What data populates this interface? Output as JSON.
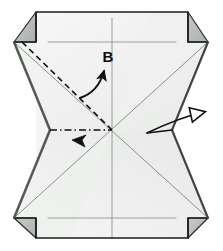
{
  "diagram": {
    "type": "origami-instruction",
    "canvas": {
      "width": 223,
      "height": 251,
      "background": "#ffffff"
    },
    "colors": {
      "paper_front": "#f2f3f2",
      "paper_front_light": "#f7f8f7",
      "paper_back_shade": "#b9bcb9",
      "paper_mid_shade": "#d9dbd9",
      "outline": "#1c1c1c",
      "soft_crease": "#9aa09a",
      "arrow": "#111111",
      "label": "#0a0a0a"
    },
    "labels": [
      {
        "id": "label-b",
        "text": "B",
        "x": 108,
        "y": 62
      }
    ],
    "arrows": [
      {
        "id": "arrow-b",
        "name": "fold-arrow-b",
        "style": "curved-solid",
        "from": {
          "x": 83,
          "y": 96
        },
        "to": {
          "x": 105,
          "y": 68
        },
        "points_to_label": "B"
      },
      {
        "id": "arrow-a",
        "name": "fold-arrowhead-a",
        "style": "arrowhead-only",
        "at": {
          "x": 78,
          "y": 140
        },
        "direction": "down-left"
      },
      {
        "id": "arrow-right",
        "name": "unfold-arrow-right",
        "style": "curved-open-head",
        "from": {
          "x": 148,
          "y": 132
        },
        "to": {
          "x": 213,
          "y": 113
        },
        "direction": "right"
      }
    ],
    "creases": [
      {
        "id": "crease-valley-b",
        "name": "dashed-valley-crease",
        "style": "dashed",
        "from": {
          "x": 22,
          "y": 42
        },
        "to": {
          "x": 112,
          "y": 130
        }
      },
      {
        "id": "crease-dashdot-a",
        "name": "dash-dot-crease",
        "style": "dash-dot",
        "from": {
          "x": 50,
          "y": 130
        },
        "to": {
          "x": 112,
          "y": 130
        }
      },
      {
        "id": "crease-diag-1",
        "name": "diagonal-crease-nw-se",
        "style": "thin-solid",
        "from": {
          "x": 14,
          "y": 42
        },
        "to": {
          "x": 208,
          "y": 218
        }
      },
      {
        "id": "crease-diag-2",
        "name": "diagonal-crease-sw-ne",
        "style": "thin-solid",
        "from": {
          "x": 14,
          "y": 218
        },
        "to": {
          "x": 208,
          "y": 42
        }
      },
      {
        "id": "crease-vertical",
        "name": "vertical-center-crease",
        "style": "thin-solid",
        "from": {
          "x": 112,
          "y": 18
        },
        "to": {
          "x": 112,
          "y": 238
        }
      },
      {
        "id": "crease-horiz-top",
        "name": "horizontal-crease-top",
        "style": "thin-solid",
        "from": {
          "x": 48,
          "y": 42
        },
        "to": {
          "x": 176,
          "y": 42
        }
      },
      {
        "id": "crease-horiz-bottom",
        "name": "horizontal-crease-bottom",
        "style": "thin-solid",
        "from": {
          "x": 48,
          "y": 218
        },
        "to": {
          "x": 176,
          "y": 218
        }
      }
    ],
    "shapes": {
      "main_outline": "M 36,12 L 188,12 L 188,42 L 208,42 L 172,130 L 208,218 L 188,218 L 188,238 L 36,238 L 36,218 L 14,218 L 50,130 L 14,42 L 36,42 Z",
      "flaps": [
        {
          "id": "flap-top-left",
          "name": "corner-flap-top-left",
          "path": "M 36,12 L 36,42 L 14,42 Z"
        },
        {
          "id": "flap-top-right",
          "name": "corner-flap-top-right",
          "path": "M 188,12 L 208,42 L 188,42 Z"
        },
        {
          "id": "flap-bottom-left",
          "name": "corner-flap-bottom-left",
          "path": "M 36,238 L 14,218 L 36,218 Z"
        },
        {
          "id": "flap-bottom-right",
          "name": "corner-flap-bottom-right",
          "path": "M 188,238 L 188,218 L 208,218 Z"
        }
      ]
    }
  }
}
